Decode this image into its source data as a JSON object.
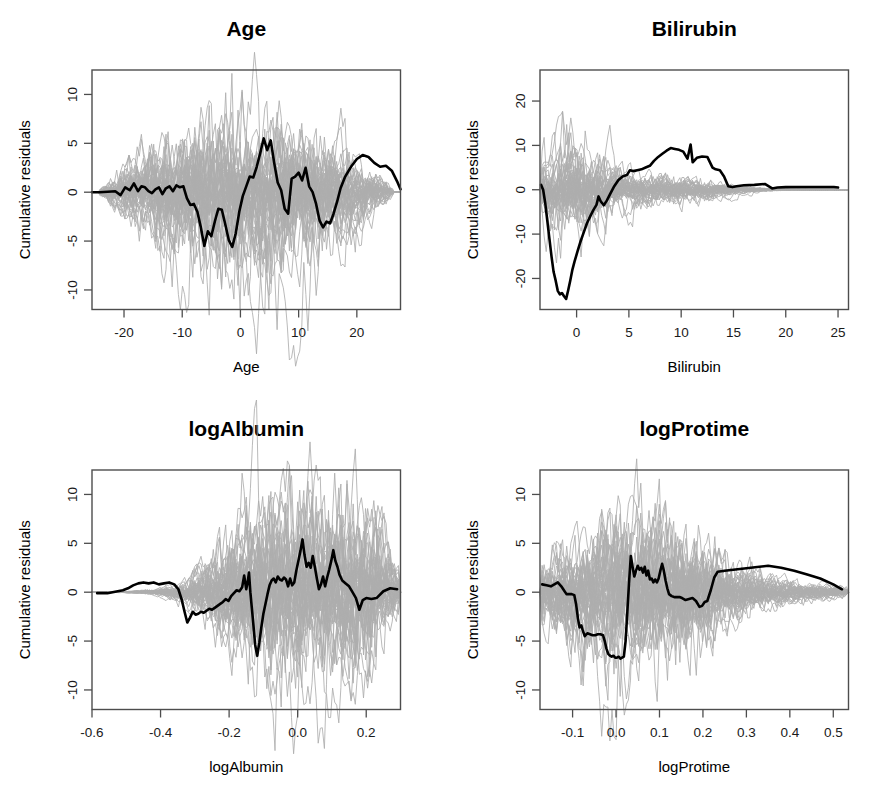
{
  "figure": {
    "layout": "2x2-grid",
    "background": "#ffffff",
    "sim_color": "#adadad",
    "obs_color": "#000000",
    "axis_color": "#4d4d4d",
    "shared_ylabel": "Cumulative residuals"
  },
  "chart_data": [
    {
      "type": "line",
      "title": "Age",
      "xlabel": "Age",
      "ylabel": "Cumulative residuals",
      "xlim": [
        -25.5,
        27.5
      ],
      "ylim": [
        -12.0,
        12.5
      ],
      "xticks": [
        -20,
        -10,
        0,
        10,
        20
      ],
      "xticklabels": [
        "-20",
        "-10",
        "0",
        "10",
        "20"
      ],
      "yticks": [
        -10,
        -5,
        0,
        5,
        10
      ],
      "yticklabels": [
        "-10",
        "-5",
        "0",
        "5",
        "10"
      ],
      "grid": false,
      "legend": "none",
      "n_sim_paths": 50,
      "sim_envelope_peak": 10.5,
      "observed": {
        "name": "observed cumulative residual process",
        "x": [
          -25.5,
          -24.2,
          -22.8,
          -21.5,
          -20.6,
          -19.8,
          -19.0,
          -18.3,
          -17.6,
          -17.0,
          -16.4,
          -15.8,
          -15.2,
          -14.6,
          -14.0,
          -13.4,
          -12.8,
          -12.2,
          -11.6,
          -11.0,
          -10.4,
          -9.8,
          -9.2,
          -8.6,
          -8.0,
          -7.4,
          -6.8,
          -6.2,
          -5.6,
          -5.0,
          -4.4,
          -3.8,
          -3.2,
          -2.6,
          -2.0,
          -1.4,
          -0.8,
          -0.2,
          0.4,
          1.0,
          1.6,
          2.2,
          2.8,
          3.4,
          4.0,
          4.6,
          5.2,
          5.8,
          6.4,
          7.0,
          7.6,
          8.2,
          8.8,
          9.4,
          10.0,
          10.6,
          11.2,
          11.8,
          12.4,
          13.0,
          13.6,
          14.2,
          14.8,
          15.4,
          16.0,
          16.6,
          17.2,
          18.0,
          19.0,
          20.0,
          21.0,
          22.0,
          23.0,
          24.0,
          25.0,
          26.0,
          27.0,
          27.5
        ],
        "y": [
          0.0,
          0.0,
          0.05,
          0.1,
          -0.3,
          0.5,
          0.2,
          0.9,
          0.1,
          0.6,
          0.5,
          0.1,
          -0.1,
          0.3,
          0.5,
          -0.2,
          0.4,
          0.6,
          0.1,
          0.7,
          0.5,
          0.6,
          -0.6,
          -1.3,
          -1.2,
          -2.0,
          -3.6,
          -5.5,
          -4.0,
          -4.5,
          -3.0,
          -1.7,
          -1.8,
          -3.3,
          -4.9,
          -5.6,
          -4.2,
          -2.0,
          -0.4,
          0.6,
          1.6,
          1.5,
          2.6,
          4.0,
          5.5,
          4.3,
          5.3,
          3.0,
          1.0,
          0.2,
          -1.7,
          -2.2,
          1.4,
          1.6,
          2.0,
          1.2,
          2.5,
          0.6,
          0.0,
          -1.2,
          -2.9,
          -3.6,
          -3.0,
          -3.2,
          -2.2,
          -1.0,
          0.4,
          1.6,
          2.6,
          3.4,
          3.8,
          3.6,
          3.0,
          2.6,
          2.7,
          2.2,
          1.0,
          0.3
        ]
      }
    },
    {
      "type": "line",
      "title": "Bilirubin",
      "xlabel": "Bilirubin",
      "ylabel": "Cumulative residuals",
      "xlim": [
        -3.5,
        26.0
      ],
      "ylim": [
        -27.0,
        27.0
      ],
      "xticks": [
        0,
        5,
        10,
        15,
        20,
        25
      ],
      "xticklabels": [
        "0",
        "5",
        "10",
        "15",
        "20",
        "25"
      ],
      "yticks": [
        -20,
        -10,
        0,
        10,
        20
      ],
      "yticklabels": [
        "-20",
        "-10",
        "0",
        "10",
        "20"
      ],
      "grid": false,
      "legend": "none",
      "n_sim_paths": 50,
      "sim_envelope_peak": 13.5,
      "observed": {
        "name": "observed cumulative residual process",
        "x": [
          -3.4,
          -3.2,
          -3.0,
          -2.8,
          -2.6,
          -2.4,
          -2.2,
          -2.0,
          -1.8,
          -1.6,
          -1.4,
          -1.2,
          -1.0,
          -0.8,
          -0.6,
          -0.4,
          -0.2,
          0.1,
          0.4,
          0.7,
          1.0,
          1.3,
          1.6,
          1.9,
          2.1,
          2.3,
          2.6,
          2.9,
          3.2,
          3.6,
          4.0,
          4.4,
          4.8,
          5.1,
          5.4,
          5.8,
          6.2,
          6.6,
          7.0,
          7.4,
          7.8,
          8.2,
          8.6,
          9.0,
          9.4,
          9.8,
          10.2,
          10.6,
          10.9,
          11.1,
          11.5,
          12.0,
          12.5,
          13.0,
          13.3,
          13.7,
          14.1,
          14.5,
          14.9,
          15.3,
          16.0,
          17.0,
          18.0,
          18.7,
          19.2,
          20.0,
          21.0,
          22.0,
          23.0,
          24.0,
          24.6,
          25.0
        ],
        "y": [
          1.1,
          0.0,
          -3.0,
          -7.0,
          -11.0,
          -15.0,
          -18.5,
          -20.5,
          -22.8,
          -23.6,
          -23.3,
          -24.0,
          -24.6,
          -22.6,
          -20.4,
          -18.0,
          -16.2,
          -13.8,
          -11.5,
          -9.5,
          -7.5,
          -6.0,
          -4.6,
          -3.4,
          -1.5,
          -2.6,
          -3.5,
          -2.4,
          -1.0,
          0.8,
          2.2,
          3.0,
          3.3,
          4.4,
          4.2,
          4.4,
          4.6,
          5.0,
          5.4,
          6.5,
          7.4,
          8.1,
          8.8,
          9.4,
          9.2,
          9.0,
          8.6,
          7.0,
          10.2,
          6.2,
          7.2,
          7.5,
          7.4,
          5.0,
          4.6,
          4.4,
          3.0,
          0.8,
          0.6,
          0.8,
          1.0,
          1.1,
          1.3,
          0.3,
          0.5,
          0.6,
          0.6,
          0.6,
          0.6,
          0.6,
          0.6,
          0.5
        ]
      }
    },
    {
      "type": "line",
      "title": "logAlbumin",
      "xlabel": "logAlbumin",
      "ylabel": "Cumulative residuals",
      "xlim": [
        -0.6,
        0.3
      ],
      "ylim": [
        -12.0,
        12.5
      ],
      "xticks": [
        -0.6,
        -0.4,
        -0.2,
        0.0,
        0.2
      ],
      "xticklabels": [
        "-0.6",
        "-0.4",
        "-0.2",
        "0.0",
        "0.2"
      ],
      "yticks": [
        -10,
        -5,
        0,
        5,
        10
      ],
      "yticklabels": [
        "-10",
        "-5",
        "0",
        "5",
        "10"
      ],
      "grid": false,
      "legend": "none",
      "n_sim_paths": 50,
      "sim_envelope_peak": 11.5,
      "observed": {
        "name": "observed cumulative residual process",
        "x": [
          -0.585,
          -0.57,
          -0.555,
          -0.54,
          -0.525,
          -0.51,
          -0.495,
          -0.48,
          -0.465,
          -0.45,
          -0.435,
          -0.42,
          -0.405,
          -0.39,
          -0.375,
          -0.36,
          -0.348,
          -0.338,
          -0.33,
          -0.322,
          -0.314,
          -0.306,
          -0.298,
          -0.29,
          -0.282,
          -0.274,
          -0.266,
          -0.258,
          -0.25,
          -0.242,
          -0.234,
          -0.226,
          -0.218,
          -0.21,
          -0.202,
          -0.194,
          -0.186,
          -0.178,
          -0.17,
          -0.162,
          -0.156,
          -0.15,
          -0.146,
          -0.142,
          -0.138,
          -0.134,
          -0.13,
          -0.124,
          -0.118,
          -0.112,
          -0.106,
          -0.1,
          -0.094,
          -0.088,
          -0.082,
          -0.076,
          -0.07,
          -0.064,
          -0.058,
          -0.052,
          -0.046,
          -0.04,
          -0.034,
          -0.028,
          -0.022,
          -0.016,
          -0.01,
          -0.004,
          0.002,
          0.008,
          0.014,
          0.02,
          0.026,
          0.032,
          0.038,
          0.044,
          0.05,
          0.056,
          0.062,
          0.068,
          0.074,
          0.08,
          0.086,
          0.092,
          0.098,
          0.104,
          0.11,
          0.116,
          0.122,
          0.13,
          0.14,
          0.15,
          0.16,
          0.17,
          0.18,
          0.19,
          0.2,
          0.215,
          0.23,
          0.25,
          0.27,
          0.29
        ],
        "y": [
          -0.1,
          -0.1,
          -0.1,
          0.0,
          0.1,
          0.2,
          0.4,
          0.7,
          0.9,
          1.0,
          0.9,
          1.0,
          0.8,
          0.9,
          1.0,
          0.8,
          0.3,
          -0.8,
          -2.0,
          -3.1,
          -2.6,
          -2.0,
          -2.3,
          -2.2,
          -2.0,
          -2.1,
          -1.9,
          -1.7,
          -1.8,
          -1.6,
          -1.4,
          -1.2,
          -1.0,
          -0.7,
          -0.9,
          -0.4,
          -0.1,
          0.2,
          0.1,
          0.5,
          1.7,
          0.3,
          1.0,
          2.0,
          0.0,
          -1.5,
          -3.0,
          -5.4,
          -6.5,
          -5.2,
          -3.6,
          -2.2,
          -1.2,
          -0.2,
          0.7,
          1.2,
          1.4,
          1.0,
          1.6,
          1.3,
          1.2,
          1.5,
          1.3,
          0.6,
          1.4,
          0.7,
          1.0,
          2.2,
          3.2,
          4.2,
          5.4,
          3.8,
          2.6,
          3.0,
          2.5,
          3.7,
          2.6,
          1.4,
          0.3,
          0.8,
          1.6,
          0.6,
          1.5,
          2.3,
          3.2,
          4.3,
          3.2,
          2.6,
          1.8,
          1.2,
          0.9,
          0.6,
          0.0,
          -0.6,
          -1.8,
          -0.8,
          -0.6,
          -0.7,
          -0.6,
          0.1,
          0.4,
          0.3
        ]
      }
    },
    {
      "type": "line",
      "title": "logProtime",
      "xlabel": "logProtime",
      "ylabel": "Cumulative residuals",
      "xlim": [
        -0.175,
        0.535
      ],
      "ylim": [
        -12.0,
        12.5
      ],
      "xticks": [
        -0.1,
        0.0,
        0.1,
        0.2,
        0.3,
        0.4,
        0.5
      ],
      "xticklabels": [
        "-0.1",
        "0.0",
        "0.1",
        "0.2",
        "0.3",
        "0.4",
        "0.5"
      ],
      "yticks": [
        -10,
        -5,
        0,
        5,
        10
      ],
      "yticklabels": [
        "-10",
        "-5",
        "0",
        "5",
        "10"
      ],
      "grid": false,
      "legend": "none",
      "n_sim_paths": 50,
      "sim_envelope_peak": 11.0,
      "observed": {
        "name": "observed cumulative residual process",
        "x": [
          -0.17,
          -0.16,
          -0.15,
          -0.142,
          -0.134,
          -0.126,
          -0.12,
          -0.114,
          -0.108,
          -0.102,
          -0.096,
          -0.092,
          -0.088,
          -0.084,
          -0.08,
          -0.076,
          -0.072,
          -0.066,
          -0.06,
          -0.054,
          -0.048,
          -0.042,
          -0.036,
          -0.03,
          -0.026,
          -0.022,
          -0.018,
          -0.014,
          -0.01,
          -0.006,
          -0.002,
          0.002,
          0.006,
          0.01,
          0.014,
          0.018,
          0.022,
          0.026,
          0.03,
          0.034,
          0.038,
          0.042,
          0.046,
          0.05,
          0.054,
          0.058,
          0.062,
          0.066,
          0.07,
          0.074,
          0.078,
          0.082,
          0.086,
          0.09,
          0.094,
          0.098,
          0.102,
          0.106,
          0.11,
          0.114,
          0.118,
          0.122,
          0.128,
          0.134,
          0.14,
          0.146,
          0.152,
          0.16,
          0.168,
          0.176,
          0.184,
          0.192,
          0.198,
          0.204,
          0.21,
          0.218,
          0.226,
          0.234,
          0.25,
          0.27,
          0.29,
          0.31,
          0.33,
          0.35,
          0.38,
          0.41,
          0.44,
          0.47,
          0.5,
          0.52
        ],
        "y": [
          0.8,
          0.7,
          0.6,
          0.8,
          1.0,
          0.6,
          0.2,
          -0.2,
          -0.2,
          -0.2,
          -0.3,
          -1.2,
          -2.6,
          -3.6,
          -3.4,
          -4.0,
          -4.5,
          -4.2,
          -4.3,
          -4.4,
          -4.4,
          -4.3,
          -4.3,
          -4.4,
          -5.0,
          -5.8,
          -6.3,
          -6.5,
          -6.6,
          -6.5,
          -6.7,
          -6.7,
          -6.6,
          -6.8,
          -6.7,
          -6.6,
          -5.0,
          -2.0,
          1.0,
          3.7,
          2.6,
          1.6,
          2.2,
          2.7,
          2.3,
          2.5,
          2.0,
          2.6,
          1.7,
          2.2,
          1.3,
          1.4,
          1.0,
          1.3,
          1.0,
          1.4,
          2.2,
          2.9,
          2.2,
          1.2,
          0.4,
          -0.2,
          -0.4,
          -0.5,
          -0.5,
          -0.5,
          -0.6,
          -0.8,
          -0.7,
          -0.6,
          -0.9,
          -1.5,
          -1.4,
          -1.0,
          -0.9,
          0.2,
          1.5,
          2.1,
          2.2,
          2.3,
          2.4,
          2.5,
          2.6,
          2.7,
          2.5,
          2.2,
          1.8,
          1.4,
          0.8,
          0.3
        ]
      }
    }
  ]
}
